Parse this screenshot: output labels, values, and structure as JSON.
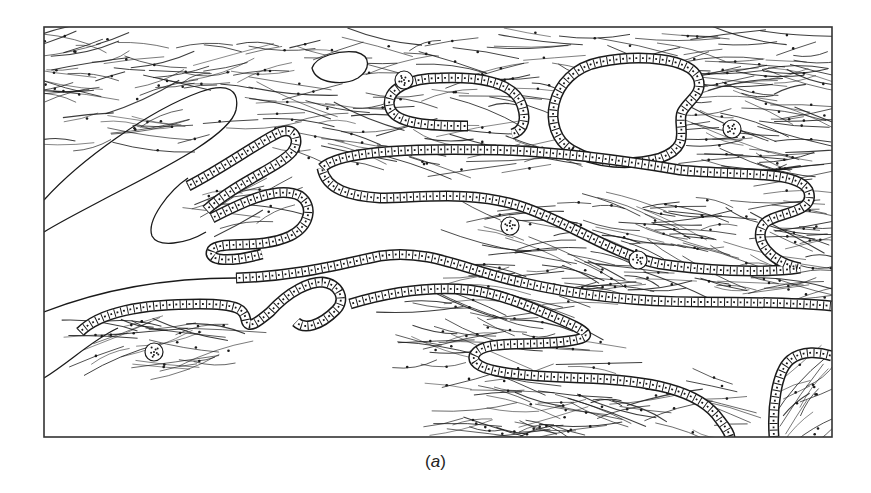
{
  "figure": {
    "caption_open": "(",
    "caption_letter": "a",
    "caption_close": ")",
    "frame": {
      "x": 44,
      "y": 27,
      "width": 788,
      "height": 410
    },
    "colors": {
      "ink": "#1a1a1a",
      "paper": "#ffffff",
      "frame": "#333333"
    },
    "elements": {
      "epithelial_tubes": [
        {
          "id": "upper-loop",
          "d": "M 468 126 C 430 126 395 124 390 108 C 384 88 412 78 440 78 C 490 76 516 86 522 106 C 528 124 520 132 512 134"
        },
        {
          "id": "round-cavity",
          "d": "M 572 150 C 540 132 548 72 600 62 C 640 54 690 58 698 78 C 704 94 688 100 682 112 C 676 126 694 146 660 158 C 630 166 596 164 572 150 Z"
        },
        {
          "id": "left-finger-upper",
          "d": "M 188 186 C 220 170 262 140 280 132 C 296 126 300 142 292 152 C 278 168 240 180 206 210"
        },
        {
          "id": "left-s-loop",
          "d": "M 212 218 C 236 206 276 184 300 196 C 314 206 310 226 290 236 C 260 250 220 240 212 250 C 206 262 232 262 262 254"
        },
        {
          "id": "long-central-duct",
          "d": "M 322 168 C 340 150 420 148 500 150 C 560 152 620 160 680 170 C 740 176 796 170 808 190 C 818 214 774 212 764 224 C 752 240 770 262 800 268 C 760 274 700 270 660 264 C 610 254 570 222 520 206 C 470 190 420 198 380 198 C 350 196 326 190 322 168"
        },
        {
          "id": "middle-duct",
          "d": "M 236 278 C 300 276 340 264 380 256 C 430 248 470 272 520 282 C 580 296 640 302 700 302 C 760 302 810 304 832 306"
        },
        {
          "id": "lower-left-wave",
          "d": "M 80 332 C 100 312 140 304 200 304 C 240 304 244 310 246 320 C 248 330 258 322 270 312 C 290 290 310 282 322 282 C 340 284 346 300 336 310 C 320 326 304 330 296 322"
        },
        {
          "id": "lower-duct",
          "d": "M 350 304 C 390 292 430 286 470 290 C 500 294 524 304 552 316 C 590 332 600 338 560 342 C 520 346 480 340 474 356 C 470 372 520 376 580 378 C 650 380 700 390 720 420 C 728 430 730 436 730 437"
        },
        {
          "id": "corner-arch",
          "d": "M 774 437 C 772 410 776 372 790 360 C 802 350 820 352 832 356"
        }
      ],
      "plain_outlines": [
        {
          "id": "left-lobe",
          "d": "M 44 200 C 80 160 150 110 200 92 C 228 82 240 90 236 110 C 230 136 160 170 110 196 C 80 212 60 222 44 232"
        },
        {
          "id": "left-inner-lobe",
          "d": "M 188 178 C 170 190 146 220 152 236 C 158 248 186 244 206 232"
        },
        {
          "id": "small-oval",
          "d": "M 312 68 C 316 56 340 50 356 52 C 372 56 370 70 358 78 C 344 86 316 84 312 68 Z"
        },
        {
          "id": "lower-left-edge",
          "d": "M 44 312 C 90 294 150 278 236 278"
        },
        {
          "id": "bottom-left-edge",
          "d": "M 44 378 C 70 362 92 340 118 328"
        }
      ],
      "dotted_nuclei": [
        {
          "cx": 404,
          "cy": 80,
          "r": 9
        },
        {
          "cx": 732,
          "cy": 129,
          "r": 9
        },
        {
          "cx": 510,
          "cy": 226,
          "r": 9
        },
        {
          "cx": 638,
          "cy": 260,
          "r": 9
        },
        {
          "cx": 154,
          "cy": 352,
          "r": 9
        }
      ],
      "fiber_fields": [
        {
          "id": "top-band",
          "x": 50,
          "y": 32,
          "w": 780,
          "h": 60,
          "count": 110,
          "angle": 0
        },
        {
          "id": "top-left",
          "x": 50,
          "y": 60,
          "w": 150,
          "h": 90,
          "count": 30,
          "angle": -6
        },
        {
          "id": "upper-middle",
          "x": 230,
          "y": 90,
          "w": 330,
          "h": 80,
          "count": 60,
          "angle": 4
        },
        {
          "id": "right-upper",
          "x": 680,
          "y": 60,
          "w": 150,
          "h": 120,
          "count": 60,
          "angle": 8
        },
        {
          "id": "left-finger-fibers",
          "x": 210,
          "y": 188,
          "w": 80,
          "h": 40,
          "count": 14,
          "angle": -12
        },
        {
          "id": "center-mass",
          "x": 470,
          "y": 200,
          "w": 330,
          "h": 90,
          "count": 110,
          "angle": 10
        },
        {
          "id": "right-edge",
          "x": 790,
          "y": 190,
          "w": 40,
          "h": 110,
          "count": 20,
          "angle": 0
        },
        {
          "id": "lower-left-fibers",
          "x": 90,
          "y": 320,
          "w": 140,
          "h": 50,
          "count": 30,
          "angle": -3
        },
        {
          "id": "lower-middle",
          "x": 400,
          "y": 300,
          "w": 200,
          "h": 70,
          "count": 40,
          "angle": 6
        },
        {
          "id": "bottom-band",
          "x": 440,
          "y": 370,
          "w": 300,
          "h": 65,
          "count": 60,
          "angle": 3
        },
        {
          "id": "corner-fibers",
          "x": 790,
          "y": 362,
          "w": 40,
          "h": 72,
          "count": 14,
          "angle": -40
        }
      ]
    }
  }
}
